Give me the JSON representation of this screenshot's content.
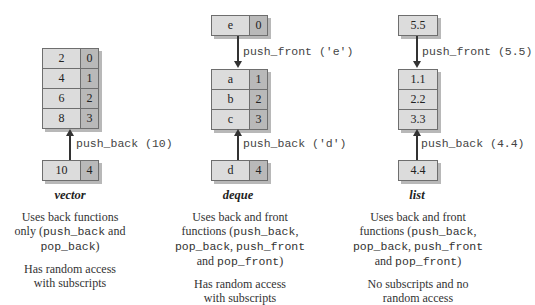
{
  "vector": {
    "title": "vector",
    "cells": [
      {
        "value": "2",
        "index": "0"
      },
      {
        "value": "4",
        "index": "1"
      },
      {
        "value": "6",
        "index": "2"
      },
      {
        "value": "8",
        "index": "3"
      }
    ],
    "back_cell": {
      "value": "10",
      "index": "4"
    },
    "back_op": "push_back (10)",
    "desc1": {
      "pre": "Uses back functions",
      "line2_pre": "only (",
      "code1": "push_back",
      "line2_post": " and",
      "code2": "pop_back",
      "line3_post": ")"
    },
    "desc2": [
      "Has random access",
      "with subscripts"
    ]
  },
  "deque": {
    "title": "deque",
    "front_cell": {
      "value": "e",
      "index": "0"
    },
    "front_op": "push_front ('e')",
    "cells": [
      {
        "value": "a",
        "index": "1"
      },
      {
        "value": "b",
        "index": "2"
      },
      {
        "value": "c",
        "index": "3"
      }
    ],
    "back_cell": {
      "value": "d",
      "index": "4"
    },
    "back_op": "push_back ('d')",
    "desc1": {
      "line1": "Uses back and front",
      "line2_pre": "functions (",
      "code1": "push_back",
      "line2_post": ",",
      "code2": "pop_back",
      "line3_mid": ", ",
      "code3": "push_front",
      "line4_pre": "and ",
      "code4": "pop_front",
      "line4_post": ")"
    },
    "desc2": [
      "Has random access",
      "with subscripts"
    ]
  },
  "list": {
    "title": "list",
    "front_cell": {
      "value": "5.5"
    },
    "front_op": "push_front (5.5)",
    "cells": [
      {
        "value": "1.1"
      },
      {
        "value": "2.2"
      },
      {
        "value": "3.3"
      }
    ],
    "back_cell": {
      "value": "4.4"
    },
    "back_op": "push_back (4.4)",
    "desc1": {
      "line1": "Uses back and front",
      "line2_pre": "functions (",
      "code1": "push_back",
      "line2_post": ",",
      "code2": "pop_back",
      "line3_mid": ", ",
      "code3": "push_front",
      "line4_pre": "and ",
      "code4": "pop_front",
      "line4_post": ")"
    },
    "desc2": [
      "No subscripts and no",
      "random access"
    ]
  },
  "colors": {
    "value_cell": "#dcdcdc",
    "index_cell": "#b9b9b9",
    "border": "#6e6e6e",
    "arrow": "#333333"
  }
}
